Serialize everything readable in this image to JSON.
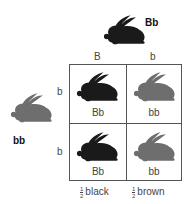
{
  "parent_top": {
    "genotype": "Bb",
    "color": "#1a1a1a"
  },
  "parent_left": {
    "genotype": "bb",
    "color": "#6e6e6e"
  },
  "gametes_top": [
    "B",
    "b"
  ],
  "gametes_left": [
    "b",
    "b"
  ],
  "cells": [
    {
      "genotype": "Bb",
      "color": "#1a1a1a"
    },
    {
      "genotype": "bb",
      "color": "#6e6e6e"
    },
    {
      "genotype": "Bb",
      "color": "#1a1a1a"
    },
    {
      "genotype": "bb",
      "color": "#6e6e6e"
    }
  ],
  "results": [
    {
      "fraction_num": "1",
      "fraction_den": "2",
      "label": "black"
    },
    {
      "fraction_num": "1",
      "fraction_den": "2",
      "label": "brown"
    }
  ]
}
